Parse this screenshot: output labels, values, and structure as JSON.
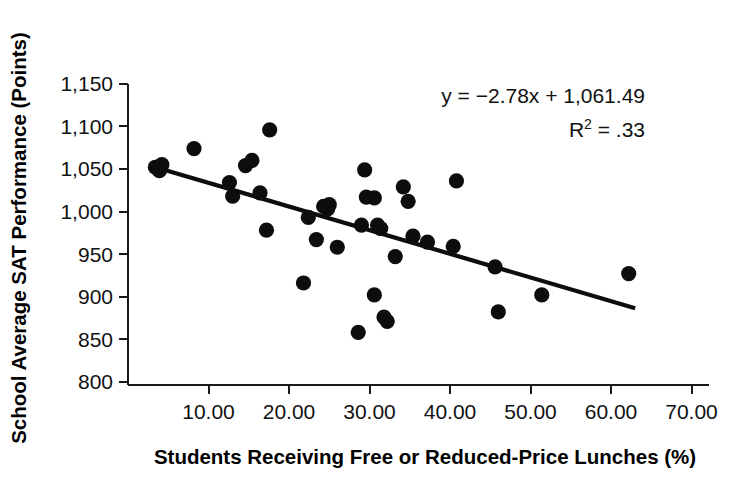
{
  "chart_data": {
    "type": "scatter",
    "title": "",
    "xlabel": "Students Receiving Free or Reduced-Price Lunches (%)",
    "ylabel": "School Average SAT Performance (Points)",
    "xlim": [
      0,
      72.5
    ],
    "ylim": [
      800,
      1160
    ],
    "xticks": [
      10,
      20,
      30,
      40,
      50,
      60,
      70
    ],
    "xtick_labels": [
      "10.00",
      "20.00",
      "30.00",
      "40.00",
      "50.00",
      "60.00",
      "70.00"
    ],
    "yticks": [
      800,
      850,
      900,
      950,
      1000,
      1050,
      1100,
      1150
    ],
    "ytick_labels": [
      "800",
      "850",
      "900",
      "950",
      "1,000",
      "1,050",
      "1,100",
      "1,150"
    ],
    "grid": false,
    "legend": null,
    "marker": "filled-circle",
    "marker_color": "#0d0d0d",
    "annotations": [
      {
        "name": "regression-equation",
        "text": "y = −2.78x + 1,061.49"
      },
      {
        "name": "r-squared",
        "text_prefix": "R",
        "text_superscript": "2",
        "text_suffix": " = .33"
      }
    ],
    "trendline": {
      "type": "linear",
      "slope": -2.78,
      "intercept": 1061.49,
      "equation": "y = −2.78x + 1,061.49",
      "r_squared": 0.33,
      "x_start": 3.4,
      "x_end": 63.0
    },
    "points": [
      {
        "x": 3.4,
        "y": 1052
      },
      {
        "x": 3.9,
        "y": 1048
      },
      {
        "x": 4.2,
        "y": 1055
      },
      {
        "x": 8.2,
        "y": 1074
      },
      {
        "x": 12.6,
        "y": 1034
      },
      {
        "x": 13.0,
        "y": 1018
      },
      {
        "x": 14.6,
        "y": 1054
      },
      {
        "x": 15.4,
        "y": 1060
      },
      {
        "x": 16.4,
        "y": 1022
      },
      {
        "x": 17.6,
        "y": 1096
      },
      {
        "x": 17.2,
        "y": 978
      },
      {
        "x": 21.8,
        "y": 916
      },
      {
        "x": 22.4,
        "y": 993
      },
      {
        "x": 23.4,
        "y": 967
      },
      {
        "x": 24.3,
        "y": 1006
      },
      {
        "x": 24.8,
        "y": 1003
      },
      {
        "x": 25.0,
        "y": 1008
      },
      {
        "x": 26.0,
        "y": 958
      },
      {
        "x": 28.6,
        "y": 858
      },
      {
        "x": 29.0,
        "y": 984
      },
      {
        "x": 29.6,
        "y": 1017
      },
      {
        "x": 29.4,
        "y": 1049
      },
      {
        "x": 30.6,
        "y": 902
      },
      {
        "x": 30.6,
        "y": 1016
      },
      {
        "x": 31.0,
        "y": 984
      },
      {
        "x": 31.4,
        "y": 980
      },
      {
        "x": 31.8,
        "y": 876
      },
      {
        "x": 32.2,
        "y": 871
      },
      {
        "x": 33.2,
        "y": 947
      },
      {
        "x": 34.2,
        "y": 1029
      },
      {
        "x": 34.8,
        "y": 1012
      },
      {
        "x": 35.4,
        "y": 971
      },
      {
        "x": 37.2,
        "y": 964
      },
      {
        "x": 40.4,
        "y": 959
      },
      {
        "x": 40.8,
        "y": 1036
      },
      {
        "x": 45.6,
        "y": 935
      },
      {
        "x": 46.0,
        "y": 882
      },
      {
        "x": 51.4,
        "y": 902
      },
      {
        "x": 62.2,
        "y": 927
      }
    ]
  },
  "axes": {
    "y_title": "School Average SAT Performance (Points)",
    "x_title": "Students Receiving Free or Reduced-Price Lunches (%)"
  },
  "equation": {
    "line1": "y = −2.78x + 1,061.49",
    "r_label": "R",
    "r_exponent": "2",
    "r_value": " = .33"
  },
  "colors": {
    "marker": "#0d0d0d",
    "axis": "#1a1a1a",
    "background": "#ffffff",
    "text": "#111111"
  }
}
